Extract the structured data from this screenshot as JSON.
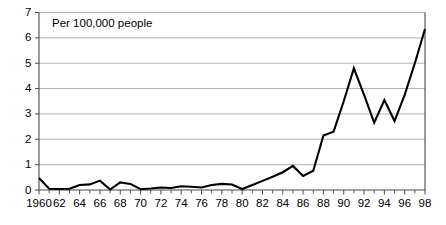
{
  "chart_data": {
    "type": "line",
    "title": "",
    "subtitle": "",
    "xlabel": "",
    "ylabel": "",
    "annotation": "Per 100,000 people",
    "grid": "horizontal",
    "legend": "none",
    "xlim": [
      1960,
      1998
    ],
    "ylim": [
      0,
      7
    ],
    "ytick_labels": [
      "0",
      "1",
      "2",
      "3",
      "4",
      "5",
      "6",
      "7"
    ],
    "ytick_values": [
      0,
      1,
      2,
      3,
      4,
      5,
      6,
      7
    ],
    "xtick_labels": [
      "1960",
      "62",
      "64",
      "66",
      "68",
      "70",
      "72",
      "74",
      "76",
      "78",
      "80",
      "82",
      "84",
      "86",
      "88",
      "90",
      "92",
      "94",
      "96",
      "98"
    ],
    "xtick_values": [
      1960,
      1962,
      1964,
      1966,
      1968,
      1970,
      1972,
      1974,
      1976,
      1978,
      1980,
      1982,
      1984,
      1986,
      1988,
      1990,
      1992,
      1994,
      1996,
      1998
    ],
    "x": [
      1960,
      1961,
      1962,
      1963,
      1964,
      1965,
      1966,
      1967,
      1968,
      1969,
      1970,
      1971,
      1972,
      1973,
      1974,
      1975,
      1976,
      1977,
      1978,
      1979,
      1980,
      1981,
      1982,
      1983,
      1984,
      1985,
      1986,
      1987,
      1988,
      1989,
      1990,
      1991,
      1992,
      1993,
      1994,
      1995,
      1996,
      1997,
      1998
    ],
    "values": [
      0.47,
      0.05,
      0.04,
      0.05,
      0.2,
      0.22,
      0.37,
      0.02,
      0.3,
      0.24,
      0.03,
      0.06,
      0.1,
      0.08,
      0.15,
      0.13,
      0.1,
      0.2,
      0.24,
      0.22,
      0.04,
      0.2,
      0.36,
      0.52,
      0.7,
      0.95,
      0.55,
      0.76,
      2.15,
      2.3,
      3.5,
      4.8,
      3.75,
      2.65,
      3.55,
      2.72,
      3.75,
      5.0,
      6.35
    ],
    "series_name": "rate",
    "line_color": "#000000",
    "grid_color": "#a8a8a8",
    "axis_color": "#4a4a4a",
    "background": "#ffffff"
  }
}
